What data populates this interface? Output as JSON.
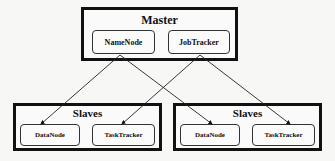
{
  "diagram": {
    "master": {
      "title": "Master",
      "nodes": [
        {
          "id": "namenode",
          "label": "NameNode"
        },
        {
          "id": "jobtracker",
          "label": "JobTracker"
        }
      ]
    },
    "slaves": [
      {
        "title": "Slaves",
        "nodes": [
          {
            "id": "datanode-1",
            "label": "DataNode"
          },
          {
            "id": "tasktracker-1",
            "label": "TaskTracker"
          }
        ]
      },
      {
        "title": "Slaves",
        "nodes": [
          {
            "id": "datanode-2",
            "label": "DataNode"
          },
          {
            "id": "tasktracker-2",
            "label": "TaskTracker"
          }
        ]
      }
    ],
    "edges": [
      {
        "from": "namenode",
        "to": "datanode-1"
      },
      {
        "from": "namenode",
        "to": "datanode-2"
      },
      {
        "from": "jobtracker",
        "to": "tasktracker-1"
      },
      {
        "from": "jobtracker",
        "to": "tasktracker-2"
      }
    ]
  }
}
